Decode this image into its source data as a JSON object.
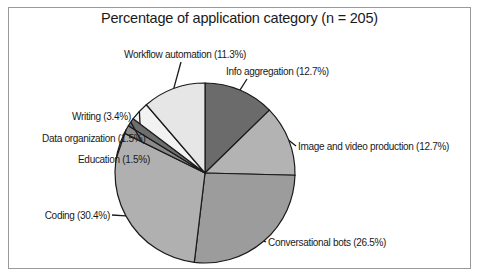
{
  "chart_data": {
    "type": "pie",
    "title": "Percentage of application category (n = 205)",
    "n": 205,
    "start_angle": "12 o'clock",
    "direction": "clockwise",
    "slices": [
      {
        "label": "Info aggregation",
        "value": 12.7,
        "display": "Info aggregation (12.7%)",
        "color": "#6b6b6b"
      },
      {
        "label": "Image and video production",
        "value": 12.7,
        "display": "Image and video production (12.7%)",
        "color": "#b3b3b3"
      },
      {
        "label": "Conversational bots",
        "value": 26.5,
        "display": "Conversational bots (26.5%)",
        "color": "#9c9c9c"
      },
      {
        "label": "Coding",
        "value": 30.4,
        "display": "Coding (30.4%)",
        "color": "#b0b0b0"
      },
      {
        "label": "Education",
        "value": 1.5,
        "display": "Education (1.5%)",
        "color": "#8a8a8a"
      },
      {
        "label": "Data organization",
        "value": 1.5,
        "display": "Data organization (1.5%)",
        "color": "#6e6e6e"
      },
      {
        "label": "Writing",
        "value": 3.4,
        "display": "Writing (3.4%)",
        "color": "#f2f2f2"
      },
      {
        "label": "Workflow automation",
        "value": 11.3,
        "display": "Workflow automation (11.3%)",
        "color": "#e6e6e6"
      }
    ],
    "legend": "none (direct labels with leader lines)"
  }
}
